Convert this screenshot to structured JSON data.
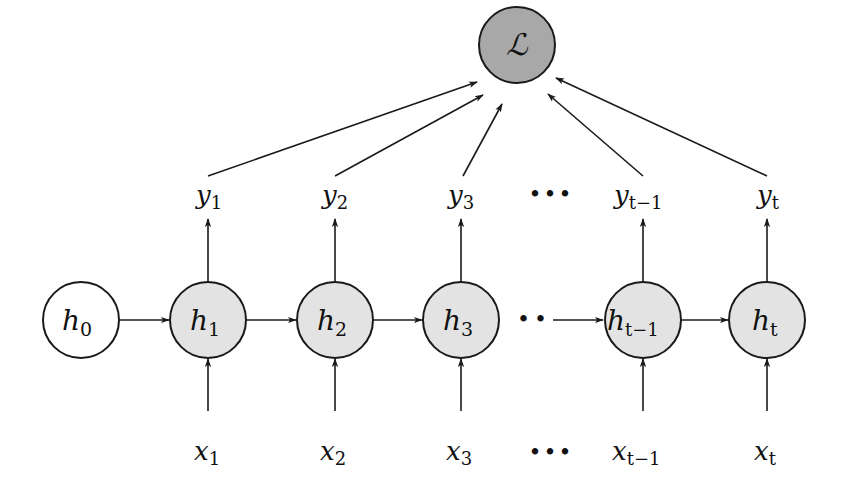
{
  "diagram": {
    "type": "unrolled-rnn",
    "colors": {
      "loss_fill": "#a8a8a8",
      "hidden_fill": "#e3e3e3",
      "h0_fill": "#ffffff",
      "stroke": "#1a1a1a"
    },
    "loss": {
      "label": "ℒ",
      "cx": 517,
      "cy": 45
    },
    "initial_state": {
      "label": "h",
      "sub": "0",
      "cx": 81,
      "cy": 320
    },
    "hidden": [
      {
        "label": "h",
        "sub": "1",
        "cx": 208
      },
      {
        "label": "h",
        "sub": "2",
        "cx": 335
      },
      {
        "label": "h",
        "sub": "3",
        "cx": 461
      },
      {
        "label": "h",
        "sub": "t−1",
        "cx": 643
      },
      {
        "label": "h",
        "sub": "t",
        "cx": 767
      }
    ],
    "outputs": [
      {
        "label": "y",
        "sub": "1"
      },
      {
        "label": "y",
        "sub": "2"
      },
      {
        "label": "y",
        "sub": "3"
      },
      {
        "label": "y",
        "sub": "t−1"
      },
      {
        "label": "y",
        "sub": "t"
      }
    ],
    "inputs": [
      {
        "label": "x",
        "sub": "1"
      },
      {
        "label": "x",
        "sub": "2"
      },
      {
        "label": "x",
        "sub": "3"
      },
      {
        "label": "x",
        "sub": "t−1"
      },
      {
        "label": "x",
        "sub": "t"
      }
    ],
    "ellipsis_outputs": "•••",
    "ellipsis_inputs": "•••",
    "ellipsis_hidden": "••"
  }
}
